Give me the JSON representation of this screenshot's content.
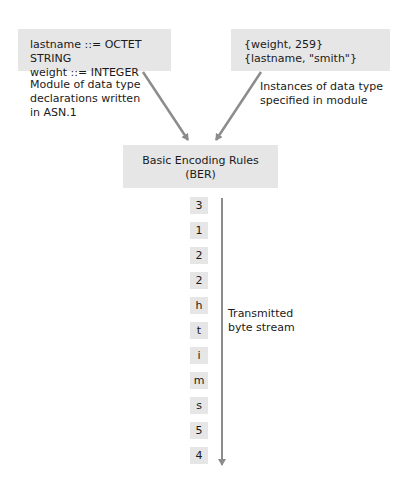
{
  "module_box": {
    "lines": [
      "lastname ::= OCTET STRING",
      "weight ::= INTEGER"
    ],
    "caption": [
      "Module of data type",
      "declarations written",
      "in ASN.1"
    ]
  },
  "instances_box": {
    "lines": [
      "{weight, 259}",
      "{lastname, \"smith\"}"
    ],
    "caption": [
      "Instances of data type",
      "specified in module"
    ]
  },
  "ber_box": {
    "lines": [
      "Basic Encoding Rules",
      "(BER)"
    ]
  },
  "byte_stream": {
    "bytes": [
      "3",
      "1",
      "2",
      "2",
      "h",
      "t",
      "i",
      "m",
      "s",
      "5",
      "4"
    ],
    "caption": [
      "Transmitted",
      "byte stream"
    ]
  },
  "colors": {
    "box_fill": "#e6e6e6",
    "arrow": "#8c8c8c",
    "text": "#1a1a1a"
  }
}
